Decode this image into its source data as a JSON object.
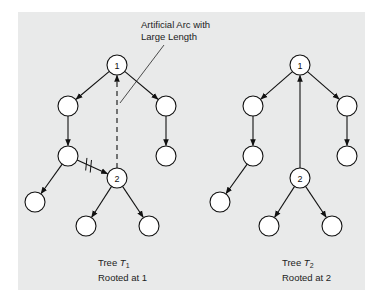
{
  "annotation": {
    "line1": "Artificial Arc with",
    "line2": "Large Length"
  },
  "trees": [
    {
      "id": "T1",
      "caption_prefix": "Tree ",
      "caption_symbol": "T",
      "caption_subscript": "1",
      "caption_line2": "Rooted at 1",
      "nodes": [
        {
          "id": "a",
          "label": "1"
        },
        {
          "id": "b",
          "label": ""
        },
        {
          "id": "c",
          "label": ""
        },
        {
          "id": "d",
          "label": ""
        },
        {
          "id": "e",
          "label": ""
        },
        {
          "id": "f",
          "label": "2"
        },
        {
          "id": "g",
          "label": ""
        },
        {
          "id": "h",
          "label": ""
        },
        {
          "id": "i",
          "label": ""
        }
      ],
      "arcs": [
        {
          "from": "a",
          "to": "b",
          "style": "solid"
        },
        {
          "from": "a",
          "to": "c",
          "style": "solid"
        },
        {
          "from": "b",
          "to": "d",
          "style": "solid"
        },
        {
          "from": "c",
          "to": "e",
          "style": "solid"
        },
        {
          "from": "d",
          "to": "g",
          "style": "solid"
        },
        {
          "from": "d",
          "to": "f",
          "style": "solid",
          "removed": true
        },
        {
          "from": "f",
          "to": "h",
          "style": "solid"
        },
        {
          "from": "f",
          "to": "i",
          "style": "solid"
        },
        {
          "from": "f",
          "to": "a",
          "style": "dashed",
          "artificial": true
        }
      ]
    },
    {
      "id": "T2",
      "caption_prefix": "Tree ",
      "caption_symbol": "T",
      "caption_subscript": "2",
      "caption_line2": "Rooted at 2",
      "nodes": [
        {
          "id": "a",
          "label": "1"
        },
        {
          "id": "b",
          "label": ""
        },
        {
          "id": "c",
          "label": ""
        },
        {
          "id": "d",
          "label": ""
        },
        {
          "id": "e",
          "label": ""
        },
        {
          "id": "f",
          "label": "2"
        },
        {
          "id": "g",
          "label": ""
        },
        {
          "id": "h",
          "label": ""
        },
        {
          "id": "i",
          "label": ""
        }
      ],
      "arcs": [
        {
          "from": "a",
          "to": "b",
          "style": "solid"
        },
        {
          "from": "a",
          "to": "c",
          "style": "solid"
        },
        {
          "from": "b",
          "to": "d",
          "style": "solid"
        },
        {
          "from": "c",
          "to": "e",
          "style": "solid"
        },
        {
          "from": "d",
          "to": "g",
          "style": "solid"
        },
        {
          "from": "f",
          "to": "h",
          "style": "solid"
        },
        {
          "from": "f",
          "to": "i",
          "style": "solid"
        },
        {
          "from": "f",
          "to": "a",
          "style": "solid"
        }
      ]
    }
  ]
}
